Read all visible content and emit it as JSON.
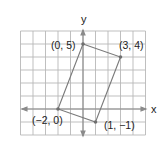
{
  "chart_data": {
    "type": "scatter",
    "title": "",
    "xlabel": "x",
    "ylabel": "y",
    "xlim": [
      -5,
      5
    ],
    "ylim": [
      -2,
      6
    ],
    "grid": true,
    "shape": "parallelogram",
    "points": [
      {
        "x": 0,
        "y": 5,
        "label": "(0, 5)"
      },
      {
        "x": 3,
        "y": 4,
        "label": "(3, 4)"
      },
      {
        "x": 1,
        "y": -1,
        "label": "(1, −1)"
      },
      {
        "x": -2,
        "y": 0,
        "label": "(−2, 0)"
      }
    ],
    "colors": {
      "grid": "#b8b8b8",
      "axis": "#8a8a8a",
      "polygon": "#7a7a7a",
      "text": "#222222"
    }
  },
  "axes": {
    "x_label": "x",
    "y_label": "y"
  },
  "labels": {
    "p0": "(0, 5)",
    "p1": "(3, 4)",
    "p2": "(1, −1)",
    "p3": "(−2, 0)"
  }
}
